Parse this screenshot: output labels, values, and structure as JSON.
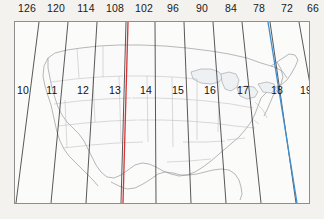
{
  "map": {
    "title": "UTM zone grid over the contiguous United States",
    "projection_note": "conic, meridians converging toward the top",
    "frame": {
      "x": 14,
      "y": 21,
      "width": 296,
      "height": 183
    },
    "background_color": "#f3f2ee",
    "map_fill_color": "#fbfbfa",
    "border_color": "#8e8e8e",
    "graticule_color": "#3a3a3a",
    "coastline_color": "#8d8d8d",
    "state_border_color": "#b4b4b4",
    "lake_fill_color": "#eef1f4"
  },
  "longitude_axis": {
    "label_unit": "degrees west",
    "ticks": [
      {
        "label": "126",
        "x": 27
      },
      {
        "label": "120",
        "x": 56
      },
      {
        "label": "114",
        "x": 86
      },
      {
        "label": "108",
        "x": 115
      },
      {
        "label": "102",
        "x": 144
      },
      {
        "label": "96",
        "x": 173
      },
      {
        "label": "90",
        "x": 202
      },
      {
        "label": "84",
        "x": 231
      },
      {
        "label": "78",
        "x": 259
      },
      {
        "label": "72",
        "x": 287
      },
      {
        "label": "66",
        "x": 313
      }
    ]
  },
  "zones": {
    "label_unit": "UTM zone number",
    "items": [
      {
        "label": "10",
        "x": 22,
        "y": 89
      },
      {
        "label": "11",
        "x": 51,
        "y": 89
      },
      {
        "label": "12",
        "x": 82,
        "y": 89
      },
      {
        "label": "13",
        "x": 114,
        "y": 89
      },
      {
        "label": "14",
        "x": 145,
        "y": 89
      },
      {
        "label": "15",
        "x": 177,
        "y": 89
      },
      {
        "label": "16",
        "x": 209,
        "y": 89
      },
      {
        "label": "17",
        "x": 242,
        "y": 89
      },
      {
        "label": "18",
        "x": 276,
        "y": 89
      },
      {
        "label": "19",
        "x": 305,
        "y": 89
      }
    ]
  },
  "highlighted_meridians": [
    {
      "name": "red-meridian",
      "color": "#d83434",
      "approx_longitude": "105",
      "zone": "13",
      "x_top": 127,
      "x_bottom": 108
    },
    {
      "name": "blue-meridian",
      "color": "#3f8fd0",
      "approx_longitude": "75",
      "zone": "18",
      "x_top": 267,
      "x_bottom": 296
    }
  ]
}
